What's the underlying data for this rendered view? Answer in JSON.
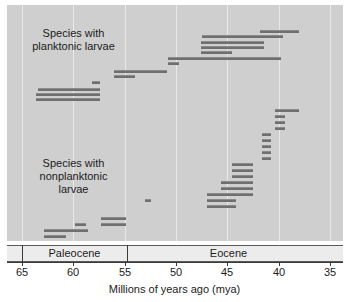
{
  "chart_data": {
    "type": "bar",
    "orientation": "horizontal-ranges",
    "title": "",
    "xlabel": "Millions of years ago (mya)",
    "ylabel": "",
    "xlim": [
      65,
      35
    ],
    "x_inverted": true,
    "xticks": [
      65,
      60,
      55,
      50,
      45,
      40,
      35
    ],
    "xticklabels": [
      "65",
      "60",
      "55",
      "50",
      "45",
      "40",
      "35"
    ],
    "grid": "vertical",
    "legend": "none",
    "annotations": [
      {
        "text": "Species with\nplanktonic larvae",
        "x_mya": 62.0,
        "y_index": 1
      },
      {
        "text": "Species with\nnonplanktonic\nlarvae",
        "x_mya": 62.0,
        "y_index": 26
      }
    ],
    "epochs": [
      {
        "name": "Paleocene",
        "start_mya": 65.0,
        "end_mya": 55.5
      },
      {
        "name": "Eocene",
        "start_mya": 55.5,
        "end_mya": 35.0
      }
    ],
    "groups": [
      {
        "name": "Species with planktonic larvae",
        "bars": [
          {
            "start_mya": 41.8,
            "end_mya": 38.0,
            "y": 25
          },
          {
            "start_mya": 47.5,
            "end_mya": 39.6,
            "y": 30
          },
          {
            "start_mya": 47.6,
            "end_mya": 41.4,
            "y": 36
          },
          {
            "start_mya": 47.6,
            "end_mya": 41.4,
            "y": 41
          },
          {
            "start_mya": 47.6,
            "end_mya": 44.5,
            "y": 46
          },
          {
            "start_mya": 50.8,
            "end_mya": 39.8,
            "y": 52
          },
          {
            "start_mya": 50.8,
            "end_mya": 49.7,
            "y": 57
          },
          {
            "start_mya": 56.0,
            "end_mya": 50.9,
            "y": 65
          },
          {
            "start_mya": 56.0,
            "end_mya": 54.0,
            "y": 70
          },
          {
            "start_mya": 58.2,
            "end_mya": 57.4,
            "y": 76
          },
          {
            "start_mya": 63.4,
            "end_mya": 57.4,
            "y": 83
          },
          {
            "start_mya": 63.6,
            "end_mya": 57.4,
            "y": 88
          },
          {
            "start_mya": 63.6,
            "end_mya": 57.4,
            "y": 93
          }
        ]
      },
      {
        "name": "Species with nonplanktonic larvae",
        "bars": [
          {
            "start_mya": 40.4,
            "end_mya": 38.0,
            "y": 104
          },
          {
            "start_mya": 40.4,
            "end_mya": 39.4,
            "y": 110
          },
          {
            "start_mya": 40.4,
            "end_mya": 39.4,
            "y": 116
          },
          {
            "start_mya": 40.4,
            "end_mya": 39.4,
            "y": 122
          },
          {
            "start_mya": 41.6,
            "end_mya": 40.7,
            "y": 128
          },
          {
            "start_mya": 41.6,
            "end_mya": 40.7,
            "y": 134
          },
          {
            "start_mya": 41.6,
            "end_mya": 40.7,
            "y": 140
          },
          {
            "start_mya": 41.6,
            "end_mya": 40.7,
            "y": 146
          },
          {
            "start_mya": 41.6,
            "end_mya": 40.7,
            "y": 152
          },
          {
            "start_mya": 44.5,
            "end_mya": 42.5,
            "y": 158
          },
          {
            "start_mya": 44.5,
            "end_mya": 42.5,
            "y": 164
          },
          {
            "start_mya": 44.5,
            "end_mya": 42.5,
            "y": 170
          },
          {
            "start_mya": 45.6,
            "end_mya": 42.5,
            "y": 176
          },
          {
            "start_mya": 45.6,
            "end_mya": 42.5,
            "y": 182
          },
          {
            "start_mya": 47.0,
            "end_mya": 42.5,
            "y": 188
          },
          {
            "start_mya": 47.0,
            "end_mya": 44.2,
            "y": 194
          },
          {
            "start_mya": 47.0,
            "end_mya": 44.2,
            "y": 200
          },
          {
            "start_mya": 53.0,
            "end_mya": 52.4,
            "y": 194
          },
          {
            "start_mya": 57.3,
            "end_mya": 54.9,
            "y": 212
          },
          {
            "start_mya": 57.3,
            "end_mya": 54.9,
            "y": 218
          },
          {
            "start_mya": 59.8,
            "end_mya": 58.8,
            "y": 218
          },
          {
            "start_mya": 59.8,
            "end_mya": 58.6,
            "y": 224
          },
          {
            "start_mya": 62.9,
            "end_mya": 59.8,
            "y": 224
          },
          {
            "start_mya": 62.9,
            "end_mya": 60.7,
            "y": 230
          },
          {
            "start_mya": 63.0,
            "end_mya": 61.2,
            "y": 236
          }
        ]
      }
    ]
  },
  "labels": {
    "planktonic": "Species with\nplanktonic larvae",
    "nonplanktonic": "Species with\nnonplanktonic\nlarvae",
    "axis_title": "Millions of years ago (mya)"
  },
  "epoch_labels": {
    "paleocene": "Paleocene",
    "eocene": "Eocene"
  },
  "ticks": {
    "t65": "65",
    "t60": "60",
    "t55": "55",
    "t50": "50",
    "t45": "45",
    "t40": "40",
    "t35": "35"
  },
  "colors": {
    "plot_background": "#cfcfcf",
    "bar": "#6f6f6f",
    "gridline": "#e9e9e9",
    "axis": "#3a3a3a",
    "epoch_band": "#ececec",
    "text": "#1c1c1c"
  }
}
